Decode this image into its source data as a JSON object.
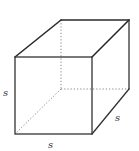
{
  "figure": {
    "type": "cube",
    "labels": {
      "left_edge": "s",
      "bottom_edge": "s",
      "depth_edge": "s"
    },
    "colors": {
      "edge": "#333333",
      "hidden_edge": "#777777",
      "background": "#ffffff"
    }
  }
}
